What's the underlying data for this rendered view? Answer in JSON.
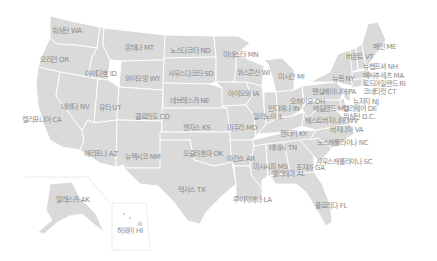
{
  "map": {
    "fill_color": "#dadada",
    "border_color": "#ffffff",
    "label_color": "#8a8a8a",
    "states": [
      {
        "code": "WA",
        "label": "워싱턴 WA",
        "x": 52,
        "y": 27
      },
      {
        "code": "OR",
        "label": "오리건 OR",
        "x": 40,
        "y": 56
      },
      {
        "code": "CA",
        "label": "캘리포니아 CA",
        "x": 22,
        "y": 116
      },
      {
        "code": "ID",
        "label": "아이다호 ID",
        "x": 85,
        "y": 70
      },
      {
        "code": "NV",
        "label": "네바다 NV",
        "x": 61,
        "y": 103
      },
      {
        "code": "MT",
        "label": "몬태나 MT",
        "x": 125,
        "y": 44
      },
      {
        "code": "WY",
        "label": "와이오밍 WY",
        "x": 125,
        "y": 75
      },
      {
        "code": "UT",
        "label": "유타 UT",
        "x": 99,
        "y": 104
      },
      {
        "code": "AZ",
        "label": "애리조나 AZ",
        "x": 84,
        "y": 150
      },
      {
        "code": "CO",
        "label": "콜로라도 CO",
        "x": 135,
        "y": 113
      },
      {
        "code": "NM",
        "label": "뉴멕시코 NM",
        "x": 125,
        "y": 153
      },
      {
        "code": "ND",
        "label": "노스다코타 ND",
        "x": 170,
        "y": 47
      },
      {
        "code": "SD",
        "label": "사우스다코타 SD",
        "x": 168,
        "y": 70
      },
      {
        "code": "NE",
        "label": "네브래스카 NE",
        "x": 170,
        "y": 97
      },
      {
        "code": "KS",
        "label": "캔자스 KS",
        "x": 183,
        "y": 124
      },
      {
        "code": "OK",
        "label": "오클라호마 OK",
        "x": 183,
        "y": 150
      },
      {
        "code": "TX",
        "label": "텍사스 TX",
        "x": 178,
        "y": 186
      },
      {
        "code": "MN",
        "label": "미네소타 MN",
        "x": 223,
        "y": 51
      },
      {
        "code": "IA",
        "label": "아이오와 IA",
        "x": 228,
        "y": 90
      },
      {
        "code": "MO",
        "label": "미주리 MO",
        "x": 227,
        "y": 124
      },
      {
        "code": "AR",
        "label": "아칸소 AR",
        "x": 227,
        "y": 155
      },
      {
        "code": "LA",
        "label": "루이지애나 LA",
        "x": 233,
        "y": 196
      },
      {
        "code": "WI",
        "label": "위스콘신 WI",
        "x": 237,
        "y": 69
      },
      {
        "code": "IL",
        "label": "일리노이 IL",
        "x": 253,
        "y": 113
      },
      {
        "code": "MI",
        "label": "미시간 MI",
        "x": 278,
        "y": 73
      },
      {
        "code": "IN",
        "label": "인디애나 IN",
        "x": 268,
        "y": 105
      },
      {
        "code": "OH",
        "label": "오하이오 OH",
        "x": 290,
        "y": 98
      },
      {
        "code": "KY",
        "label": "켄터키 KY",
        "x": 280,
        "y": 130
      },
      {
        "code": "TN",
        "label": "테네시 TN",
        "x": 269,
        "y": 144
      },
      {
        "code": "MS",
        "label": "미시시피 MS",
        "x": 253,
        "y": 163
      },
      {
        "code": "AL",
        "label": "앨라배마 AL",
        "x": 272,
        "y": 170
      },
      {
        "code": "GA",
        "label": "조지아 GA",
        "x": 296,
        "y": 164
      },
      {
        "code": "FL",
        "label": "플로리다 FL",
        "x": 315,
        "y": 202
      },
      {
        "code": "SC",
        "label": "사우스캐롤라이나 SC",
        "x": 316,
        "y": 158
      },
      {
        "code": "NC",
        "label": "노스캐롤라이나 NC",
        "x": 317,
        "y": 139
      },
      {
        "code": "VA",
        "label": "버지니아 VA",
        "x": 330,
        "y": 126
      },
      {
        "code": "WV",
        "label": "웨스트버지니아 WV",
        "x": 305,
        "y": 117
      },
      {
        "code": "PA",
        "label": "펜실베이니아 PA",
        "x": 312,
        "y": 88
      },
      {
        "code": "NY",
        "label": "뉴욕 NY",
        "x": 332,
        "y": 75
      },
      {
        "code": "MD",
        "label": "메릴랜드 MD",
        "x": 313,
        "y": 105
      },
      {
        "code": "DE",
        "label": "델라웨어 DE",
        "x": 343,
        "y": 105
      },
      {
        "code": "DC",
        "label": "워싱턴 D.C.",
        "x": 343,
        "y": 113
      },
      {
        "code": "NJ",
        "label": "뉴저지 NJ",
        "x": 353,
        "y": 98
      },
      {
        "code": "CT",
        "label": "코네티컷 CT",
        "x": 363,
        "y": 88
      },
      {
        "code": "RI",
        "label": "로드아일랜드 RI",
        "x": 363,
        "y": 80
      },
      {
        "code": "MA",
        "label": "매사추세츠 MA",
        "x": 363,
        "y": 72
      },
      {
        "code": "NH",
        "label": "뉴햄프셔 NH",
        "x": 363,
        "y": 63
      },
      {
        "code": "VT",
        "label": "버몬트 VT",
        "x": 346,
        "y": 53
      },
      {
        "code": "ME",
        "label": "메인 ME",
        "x": 373,
        "y": 43
      },
      {
        "code": "AK",
        "label": "알래스카 AK",
        "x": 56,
        "y": 196
      },
      {
        "code": "HI",
        "label": "하와이 HI",
        "x": 117,
        "y": 227
      }
    ]
  }
}
